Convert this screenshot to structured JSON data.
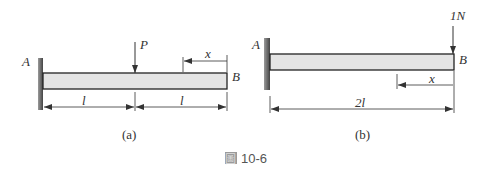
{
  "figure": {
    "caption_icon": "圖",
    "caption_number": "10-6",
    "colors": {
      "beam_fill": "#e4e4e4",
      "beam_stroke": "#222222",
      "wall": "#777777",
      "line": "#333333"
    }
  },
  "diagram_a": {
    "sublabel": "(a)",
    "support_label": "A",
    "end_label": "B",
    "load_label": "P",
    "position_label": "x",
    "span_left_label": "l",
    "span_right_label": "l"
  },
  "diagram_b": {
    "sublabel": "(b)",
    "support_label": "A",
    "end_label": "B",
    "load_label": "1N",
    "position_label": "x",
    "span_label": "2l"
  }
}
